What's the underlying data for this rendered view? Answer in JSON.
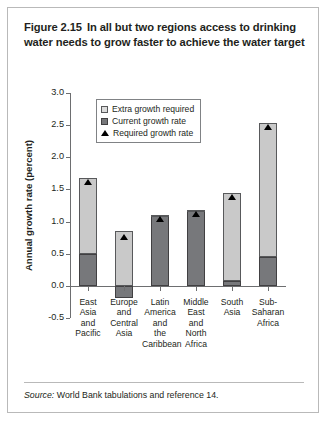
{
  "figure": {
    "number": "Figure 2.15",
    "title": "In all but two regions access to drinking water needs to grow faster to achieve the water target",
    "source_label": "Source:",
    "source_text": "World Bank tabulations and reference 14."
  },
  "legend": {
    "position": "inside-top-left",
    "items": [
      {
        "key": "extra",
        "label": "Extra growth required",
        "color": "#dcdcdc",
        "icon": "square-swatch-light"
      },
      {
        "key": "current",
        "label": "Current growth rate",
        "color": "#77787b",
        "icon": "square-swatch-dark"
      },
      {
        "key": "required",
        "label": "Required growth rate",
        "color": "#000000",
        "icon": "triangle-marker"
      }
    ]
  },
  "chart_data": {
    "type": "bar",
    "title": "In all but two regions access to drinking water needs to grow faster to achieve the water target",
    "xlabel": "",
    "ylabel": "Annual growth rate (percent)",
    "ylim": [
      -0.5,
      3.0
    ],
    "yticks": [
      "3.0",
      "2.5",
      "2.0",
      "1.5",
      "1.0",
      "0.5",
      "0.0",
      "-0.5"
    ],
    "ytick_values": [
      3.0,
      2.5,
      2.0,
      1.5,
      1.0,
      0.5,
      0.0,
      -0.5
    ],
    "grid": false,
    "stacked": true,
    "categories": [
      "East Asia and Pacific",
      "Europe and Central Asia",
      "Latin America and the Caribbean",
      "Middle East and North Africa",
      "South Asia",
      "Sub-Saharan Africa"
    ],
    "category_lines": [
      [
        "East",
        "Asia",
        "and",
        "Pacific"
      ],
      [
        "Europe",
        "and",
        "Central",
        "Asia"
      ],
      [
        "Latin",
        "America",
        "and",
        "the",
        "Caribbean"
      ],
      [
        "Middle",
        "East",
        "and North",
        "Africa"
      ],
      [
        "South",
        "Asia"
      ],
      [
        "Sub-",
        "Saharan",
        "Africa"
      ]
    ],
    "series": [
      {
        "name": "Current growth rate",
        "values": [
          0.5,
          -0.19,
          1.08,
          1.16,
          0.07,
          0.45
        ]
      },
      {
        "name": "Extra growth required",
        "values": [
          1.18,
          0.85,
          0.02,
          0.02,
          1.38,
          2.08
        ]
      },
      {
        "name": "Required growth rate",
        "type": "marker",
        "values": [
          1.68,
          0.83,
          1.1,
          1.18,
          1.45,
          2.53
        ]
      }
    ]
  }
}
